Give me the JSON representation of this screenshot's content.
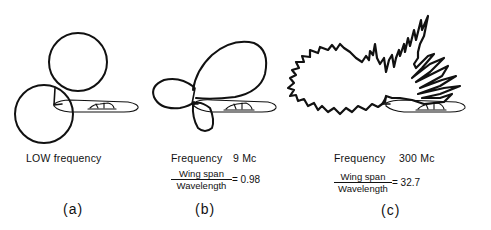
{
  "figure": {
    "panels": [
      {
        "id": "a",
        "caption": "(a)",
        "frequency_label": "LOW frequency"
      },
      {
        "id": "b",
        "caption": "(b)",
        "frequency_label": "Frequency",
        "frequency_value": "9 Mc",
        "ratio_numerator": "Wing span",
        "ratio_denominator": "Wavelength",
        "ratio_value": "= 0.98"
      },
      {
        "id": "c",
        "caption": "(c)",
        "frequency_label": "Frequency",
        "frequency_value": "300 Mc",
        "ratio_numerator": "Wing span",
        "ratio_denominator": "Wavelength",
        "ratio_value": "= 32.7"
      }
    ],
    "colors": {
      "ink": "#111111",
      "background": "#ffffff"
    }
  }
}
